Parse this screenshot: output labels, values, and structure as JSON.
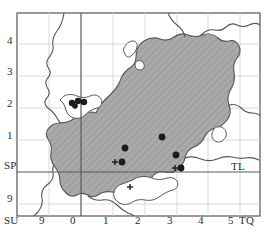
{
  "figure": {
    "name": "distribution-map",
    "type": "dot-distribution-map",
    "width": 266,
    "height": 235,
    "background_color": "#ffffff",
    "border_color": "#4a4a4a"
  },
  "styles": {
    "land_fill": "#ffffff",
    "region_fill": "#a8a8a8",
    "hatch_color": "#8f8f8f",
    "coast_line": "#4f4f4f",
    "grid_line": "#c9c9c9",
    "major_grid_line": "#6a6a6a",
    "dot_color": "#1c1c1c",
    "cross_color": "#1c1c1c",
    "frame_color": "#555555"
  },
  "axes": {
    "left_labels": [
      {
        "text": "4",
        "x": 7,
        "y": 41
      },
      {
        "text": "3",
        "x": 7,
        "y": 72
      },
      {
        "text": "2",
        "x": 7,
        "y": 104
      },
      {
        "text": "1",
        "x": 7,
        "y": 136
      },
      {
        "text": "SP",
        "x": 5,
        "y": 166
      },
      {
        "text": "9",
        "x": 7,
        "y": 200
      },
      {
        "text": "SU",
        "x": 5,
        "y": 222
      }
    ],
    "bottom_labels": [
      {
        "text": "9",
        "x": 40,
        "y": 222
      },
      {
        "text": "0",
        "x": 71,
        "y": 222
      },
      {
        "text": "1",
        "x": 104,
        "y": 222
      },
      {
        "text": "2",
        "x": 136,
        "y": 222
      },
      {
        "text": "3",
        "x": 168,
        "y": 222
      },
      {
        "text": "4",
        "x": 199,
        "y": 222
      },
      {
        "text": "5",
        "x": 229,
        "y": 222
      }
    ],
    "corner_labels": [
      {
        "text": "TL",
        "x": 232,
        "y": 167
      },
      {
        "text": "TQ",
        "x": 240,
        "y": 222
      }
    ],
    "x_tick_values": [
      9,
      0,
      1,
      2,
      3,
      4,
      5
    ],
    "y_tick_values": [
      4,
      3,
      2,
      1,
      9
    ],
    "grid_square_codes": [
      "SP",
      "SU",
      "TL",
      "TQ"
    ]
  },
  "chart_data": {
    "type": "scatter",
    "title": "",
    "xlabel": "",
    "ylabel": "",
    "xlim": [
      0,
      266
    ],
    "ylim": [
      235,
      0
    ],
    "grid": true,
    "legend": "none",
    "series": [
      {
        "name": "records-filled-circle",
        "marker": "filled-circle",
        "color": "#1c1c1c",
        "points": [
          {
            "x": 72,
            "y": 103,
            "r": 3.2
          },
          {
            "x": 78,
            "y": 101,
            "r": 3.2
          },
          {
            "x": 84,
            "y": 102,
            "r": 3.2
          },
          {
            "x": 75,
            "y": 106,
            "r": 2.8
          },
          {
            "x": 125,
            "y": 148,
            "r": 3.4
          },
          {
            "x": 162,
            "y": 137,
            "r": 3.4
          },
          {
            "x": 122,
            "y": 162,
            "r": 3.4
          },
          {
            "x": 176,
            "y": 155,
            "r": 3.4
          },
          {
            "x": 181,
            "y": 168,
            "r": 3.4
          }
        ]
      },
      {
        "name": "records-cross",
        "marker": "plus",
        "color": "#1c1c1c",
        "points": [
          {
            "x": 115,
            "y": 162,
            "r": 3.0
          },
          {
            "x": 175,
            "y": 168,
            "r": 3.0
          },
          {
            "x": 130,
            "y": 187,
            "r": 3.0
          }
        ]
      }
    ]
  }
}
